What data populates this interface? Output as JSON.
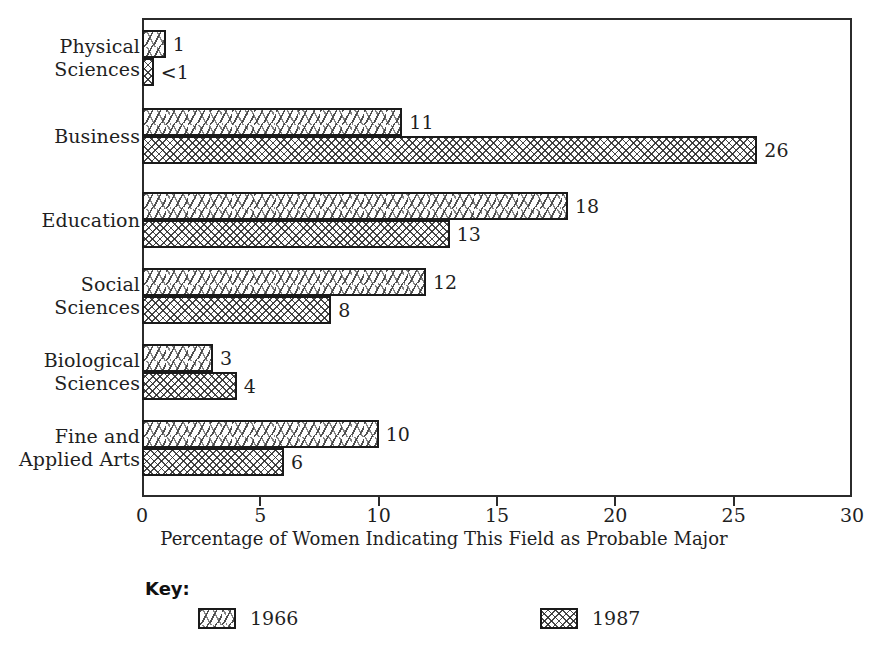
{
  "chart_data": {
    "type": "bar",
    "orientation": "horizontal",
    "title": "",
    "xlabel": "Percentage of Women Indicating This Field as Probable Major",
    "ylabel": "",
    "xlim": [
      0,
      30
    ],
    "xticks": [
      0,
      5,
      10,
      15,
      20,
      25,
      30
    ],
    "xtick_labels": [
      "0",
      "5",
      "10",
      "15",
      "20",
      "25",
      "30"
    ],
    "grid": false,
    "legend_position": "bottom",
    "legend_title": "Key:",
    "categories": [
      "Physical\nSciences",
      "Business",
      "Education",
      "Social\nSciences",
      "Biological\nSciences",
      "Fine and\nApplied Arts"
    ],
    "series": [
      {
        "name": "1966",
        "pattern": "dashes",
        "values": [
          1,
          11,
          18,
          12,
          3,
          10
        ],
        "value_labels": [
          "1",
          "11",
          "18",
          "12",
          "3",
          "10"
        ]
      },
      {
        "name": "1987",
        "pattern": "crosshatch",
        "values": [
          0.5,
          26,
          13,
          8,
          4,
          6
        ],
        "value_labels": [
          "<1",
          "26",
          "13",
          "8",
          "4",
          "6"
        ]
      }
    ]
  },
  "colors": {
    "frame": "#2b2b2b",
    "bar_outline": "#1a1a1a",
    "text": "#1f1f1f",
    "background": "#ffffff"
  }
}
